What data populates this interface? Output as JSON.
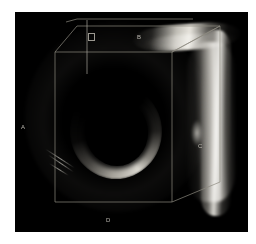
{
  "figure": {
    "kind": "3d-volume-rendering",
    "modality": "intravascular-ultrasound",
    "panel_background": "#000000",
    "page_background": "#ffffff",
    "wireframe_color": "#8c897f",
    "label_color": "#b9b6ae"
  },
  "labels": {
    "left": "A",
    "top": "B",
    "right": "C",
    "bottom": "D"
  },
  "markers": {
    "slice_marker": "",
    "slice_line": ""
  },
  "panel": {
    "x": 15,
    "y": 12,
    "width": 233,
    "height": 220
  },
  "bounding_box": {
    "front_face": {
      "top_left": [
        40,
        40
      ],
      "top_right": [
        157,
        40
      ],
      "bottom_right": [
        157,
        190
      ],
      "bottom_left": [
        40,
        190
      ]
    },
    "back_top_left": [
      62,
      14
    ],
    "back_top_right": [
      205,
      14
    ],
    "back_bottom_right": [
      205,
      170
    ],
    "depth_vector": [
      48,
      -26
    ]
  }
}
